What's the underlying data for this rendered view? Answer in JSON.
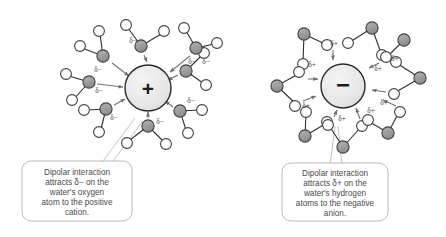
{
  "figure": {
    "background_color": "#ffffff"
  },
  "palette": {
    "oxygen_fill": "#9a9a9a",
    "hydrogen_fill": "#ffffff",
    "atom_stroke": "#3f3f3f",
    "bond_stroke": "#2f2f2f",
    "ion_fill": "#e8e8e8",
    "ion_stroke": "#2b2b2b",
    "arrow_color": "#707070",
    "callout_stroke": "#b9b9b9",
    "callout_fill": "#ffffff",
    "text_color": "#4a4a4a"
  },
  "left_panel": {
    "name": "cation-solvation-shell",
    "ion": {
      "label": "+",
      "charge": "positive",
      "cx": 148,
      "cy": 88,
      "r": 23
    },
    "partial_charge_label": "δ−",
    "partial_charge_count": 8,
    "water_molecule_count": 8,
    "oriented_atom": "oxygen",
    "callout": {
      "lines": [
        "Dipolar interaction",
        "attracts δ− on the",
        "water's oxygen",
        "atom to the positive",
        "cation."
      ]
    }
  },
  "right_panel": {
    "name": "anion-solvation-shell",
    "ion": {
      "label": "−",
      "charge": "negative",
      "cx": 343,
      "cy": 86,
      "r": 22
    },
    "partial_charge_label": "δ+",
    "partial_charge_count": 8,
    "water_molecule_count": 8,
    "oriented_atom": "hydrogen",
    "callout": {
      "lines": [
        "Dipolar interaction",
        "attracts δ+ on the",
        "water's hydrogen",
        "atoms to the negative",
        "anion."
      ]
    }
  },
  "legend_semantics": {
    "filled_gray_circle": "oxygen atom",
    "open_white_circle": "hydrogen atom",
    "large_shaded_circle_plus": "cation",
    "large_shaded_circle_minus": "anion",
    "short_arrow": "electrostatic attraction direction"
  }
}
